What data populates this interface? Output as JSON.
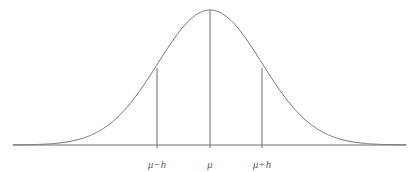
{
  "figure": {
    "kind": "normal-distribution-curve",
    "background_color": "#ffffff",
    "curve_color": "#6e6e6e",
    "axis_color": "#6e6e6e",
    "label_color": "#5a5a5a",
    "curve_line_width": 1.0,
    "axis_line_width": 1.0,
    "ordinate_line_width": 1.0
  },
  "labels": {
    "left": "μ−h",
    "center": "μ",
    "right": "μ+h"
  },
  "chart_data": {
    "type": "line",
    "title": "",
    "subtitle": "",
    "xlabel": "",
    "ylabel": "",
    "legend": [],
    "grid": false,
    "axis": {
      "baseline_y": 145,
      "x_start": 13,
      "x_end": 406,
      "ticks": [
        {
          "label": "μ−h",
          "x": 157
        },
        {
          "label": "μ",
          "x": 210
        },
        {
          "label": "μ+h",
          "x": 262
        }
      ]
    },
    "curve": {
      "description": "Gaussian bell curve, peak at mu",
      "peak": {
        "x": 210,
        "y": 10
      },
      "mean_x": 210,
      "sigma_px": 52,
      "baseline_y": 145,
      "amplitude_px": 135,
      "x_domain": [
        13,
        406
      ]
    },
    "ordinates": [
      {
        "name": "mu-minus-h",
        "x": 157,
        "y_top": 68,
        "y_bottom": 148
      },
      {
        "name": "mu",
        "x": 210,
        "y_top": 10,
        "y_bottom": 148
      },
      {
        "name": "mu-plus-h",
        "x": 262,
        "y_top": 68,
        "y_bottom": 148
      }
    ],
    "annotations": [
      {
        "text": "μ−h",
        "x": 157,
        "y": 159
      },
      {
        "text": "μ",
        "x": 210,
        "y": 159
      },
      {
        "text": "μ+h",
        "x": 262,
        "y": 159
      }
    ]
  }
}
